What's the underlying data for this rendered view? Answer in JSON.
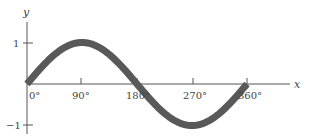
{
  "chart_data": {
    "type": "line",
    "title": "",
    "xlabel": "x",
    "ylabel": "y",
    "x_ticks": [
      "0°",
      "90°",
      "180°",
      "270°",
      "360°"
    ],
    "y_ticks": [
      "1",
      "−1"
    ],
    "xlim": [
      0,
      360
    ],
    "ylim": [
      -1,
      1
    ],
    "grid": false,
    "legend": null,
    "series": [
      {
        "name": "y = sin x",
        "x": [
          0,
          30,
          60,
          90,
          120,
          150,
          180,
          210,
          240,
          270,
          300,
          330,
          360
        ],
        "values": [
          0,
          0.5,
          0.87,
          1,
          0.87,
          0.5,
          0,
          -0.5,
          -0.87,
          -1,
          -0.87,
          -0.5,
          0
        ]
      }
    ]
  },
  "colors": {
    "curve": "#595959",
    "axis": "#555555",
    "text": "#444444"
  }
}
